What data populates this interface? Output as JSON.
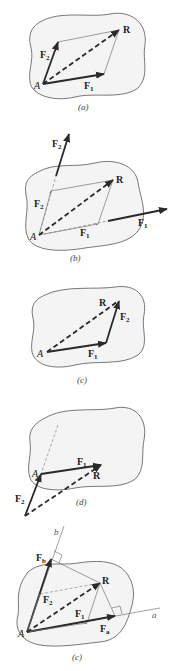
{
  "figure": {
    "panels": [
      {
        "id": "a",
        "caption": "(a)",
        "labels": {
          "origin": "A",
          "f1": "F",
          "f1_sub": "1",
          "f2": "F",
          "f2_sub": "2",
          "resultant": "R"
        },
        "description": "Parallelogram law: F1 and F2 from A, resultant R as diagonal"
      },
      {
        "id": "b",
        "caption": "(b)",
        "labels": {
          "origin": "A",
          "f1": "F",
          "f1_sub": "1",
          "f1_inner": "F",
          "f1_inner_sub": "1",
          "f2": "F",
          "f2_sub": "2",
          "f2_inner": "F",
          "f2_inner_sub": "2",
          "resultant": "R"
        },
        "description": "Forces moved along lines of action to concurrent point A"
      },
      {
        "id": "c",
        "caption": "(c)",
        "labels": {
          "origin": "A",
          "f1": "F",
          "f1_sub": "1",
          "f2": "F",
          "f2_sub": "2",
          "resultant": "R"
        },
        "description": "Triangle law: F1 head-to-tail with F2"
      },
      {
        "id": "d",
        "caption": "(d)",
        "labels": {
          "origin": "A",
          "f1": "F",
          "f1_sub": "1",
          "f2": "F",
          "f2_sub": "2",
          "resultant": "R"
        },
        "description": "Triangle law with F2 first then F1"
      },
      {
        "id": "e",
        "caption": "(c)",
        "labels": {
          "origin": "A",
          "f1": "F",
          "f1_sub": "1",
          "f2": "F",
          "f2_sub": "2",
          "fa": "F",
          "fa_sub": "a",
          "fb": "F",
          "fb_sub": "b",
          "resultant": "R",
          "axis_a": "a",
          "axis_b": "b"
        },
        "description": "Components Fa and Fb along non-perpendicular axes a and b, with perpendicular projections"
      }
    ]
  }
}
